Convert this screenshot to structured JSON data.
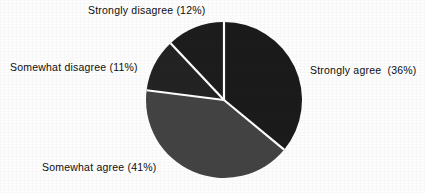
{
  "chart_data": {
    "type": "pie",
    "title": "",
    "subtitle": "",
    "xlabel": "",
    "ylabel": "",
    "legend_position": "outside-labels",
    "grid": false,
    "start_angle_deg": 0,
    "direction": "clockwise",
    "categories": [
      "Strongly agree",
      "Somewhat agree",
      "Somewhat disagree",
      "Strongly disagree"
    ],
    "values": [
      36,
      41,
      11,
      12
    ],
    "value_unit": "percent",
    "labels": [
      "Strongly agree  (36%)",
      "Somewhat agree (41%)",
      "Somewhat disagree (11%)",
      "Strongly disagree (12%)"
    ],
    "slice_colors": [
      "#1b1b1b",
      "#434343",
      "#232323",
      "#1d1d1d"
    ],
    "separator_color": "#ffffff",
    "background_color": "#fdfdfd",
    "text_color": "#0d0d0d"
  },
  "figure": {
    "center_x": 224,
    "center_y": 100,
    "radius": 78
  },
  "slice_labels": {
    "strongly_agree": "Strongly agree  (36%)",
    "somewhat_agree": "Somewhat agree (41%)",
    "somewhat_disagree": "Somewhat disagree (11%)",
    "strongly_disagree": "Strongly disagree (12%)"
  }
}
